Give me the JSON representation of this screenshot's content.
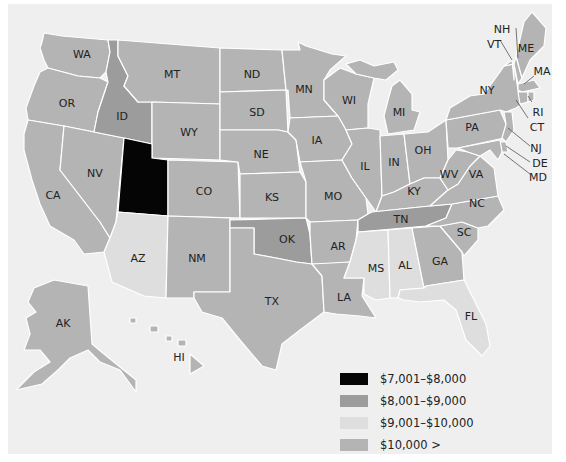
{
  "map": {
    "type": "choropleth",
    "region": "United States",
    "colors": {
      "c7001_8000": "#050505",
      "c8001_9000": "#9c9c9c",
      "c9001_10000": "#dedede",
      "c10000_plus": "#b4b4b4",
      "background": "#efefef",
      "border": "#ffffff"
    },
    "states": [
      {
        "abbr": "WA",
        "bin": "$10,000 >"
      },
      {
        "abbr": "OR",
        "bin": "$10,000 >"
      },
      {
        "abbr": "CA",
        "bin": "$10,000 >"
      },
      {
        "abbr": "NV",
        "bin": "$10,000 >"
      },
      {
        "abbr": "ID",
        "bin": "$8,001–$9,000"
      },
      {
        "abbr": "MT",
        "bin": "$10,000 >"
      },
      {
        "abbr": "WY",
        "bin": "$10,000 >"
      },
      {
        "abbr": "UT",
        "bin": "$7,001–$8,000"
      },
      {
        "abbr": "AZ",
        "bin": "$9,001–$10,000"
      },
      {
        "abbr": "CO",
        "bin": "$10,000 >"
      },
      {
        "abbr": "NM",
        "bin": "$10,000 >"
      },
      {
        "abbr": "ND",
        "bin": "$10,000 >"
      },
      {
        "abbr": "SD",
        "bin": "$10,000 >"
      },
      {
        "abbr": "NE",
        "bin": "$10,000 >"
      },
      {
        "abbr": "KS",
        "bin": "$10,000 >"
      },
      {
        "abbr": "OK",
        "bin": "$8,001–$9,000"
      },
      {
        "abbr": "TX",
        "bin": "$10,000 >"
      },
      {
        "abbr": "MN",
        "bin": "$10,000 >"
      },
      {
        "abbr": "IA",
        "bin": "$10,000 >"
      },
      {
        "abbr": "MO",
        "bin": "$10,000 >"
      },
      {
        "abbr": "AR",
        "bin": "$10,000 >"
      },
      {
        "abbr": "LA",
        "bin": "$10,000 >"
      },
      {
        "abbr": "WI",
        "bin": "$10,000 >"
      },
      {
        "abbr": "IL",
        "bin": "$10,000 >"
      },
      {
        "abbr": "MI",
        "bin": "$10,000 >"
      },
      {
        "abbr": "IN",
        "bin": "$10,000 >"
      },
      {
        "abbr": "OH",
        "bin": "$10,000 >"
      },
      {
        "abbr": "KY",
        "bin": "$10,000 >"
      },
      {
        "abbr": "TN",
        "bin": "$8,001–$9,000"
      },
      {
        "abbr": "MS",
        "bin": "$9,001–$10,000"
      },
      {
        "abbr": "AL",
        "bin": "$9,001–$10,000"
      },
      {
        "abbr": "GA",
        "bin": "$10,000 >"
      },
      {
        "abbr": "FL",
        "bin": "$9,001–$10,000"
      },
      {
        "abbr": "SC",
        "bin": "$10,000 >"
      },
      {
        "abbr": "NC",
        "bin": "$10,000 >"
      },
      {
        "abbr": "VA",
        "bin": "$10,000 >"
      },
      {
        "abbr": "WV",
        "bin": "$10,000 >"
      },
      {
        "abbr": "PA",
        "bin": "$10,000 >"
      },
      {
        "abbr": "NY",
        "bin": "$10,000 >"
      },
      {
        "abbr": "VT",
        "bin": "$10,000 >"
      },
      {
        "abbr": "NH",
        "bin": "$10,000 >"
      },
      {
        "abbr": "ME",
        "bin": "$10,000 >"
      },
      {
        "abbr": "MA",
        "bin": "$10,000 >"
      },
      {
        "abbr": "RI",
        "bin": "$10,000 >"
      },
      {
        "abbr": "CT",
        "bin": "$10,000 >"
      },
      {
        "abbr": "NJ",
        "bin": "$10,000 >"
      },
      {
        "abbr": "DE",
        "bin": "$10,000 >"
      },
      {
        "abbr": "MD",
        "bin": "$10,000 >"
      },
      {
        "abbr": "AK",
        "bin": "$10,000 >"
      },
      {
        "abbr": "HI",
        "bin": "$10,000 >"
      }
    ],
    "labels": {
      "WA": "WA",
      "OR": "OR",
      "CA": "CA",
      "NV": "NV",
      "ID": "ID",
      "MT": "MT",
      "WY": "WY",
      "CO": "CO",
      "AZ": "AZ",
      "NM": "NM",
      "ND": "ND",
      "SD": "SD",
      "NE": "NE",
      "KS": "KS",
      "OK": "OK",
      "TX": "TX",
      "MN": "MN",
      "IA": "IA",
      "MO": "MO",
      "AR": "AR",
      "LA": "LA",
      "WI": "WI",
      "IL": "IL",
      "MI": "MI",
      "IN": "IN",
      "OH": "OH",
      "KY": "KY",
      "TN": "TN",
      "MS": "MS",
      "AL": "AL",
      "GA": "GA",
      "FL": "FL",
      "SC": "SC",
      "NC": "NC",
      "VA": "VA",
      "WV": "WV",
      "PA": "PA",
      "NY": "NY",
      "VT": "VT",
      "NH": "NH",
      "ME": "ME",
      "MA": "MA",
      "RI": "RI",
      "CT": "CT",
      "NJ": "NJ",
      "DE": "DE",
      "MD": "MD",
      "AK": "AK",
      "HI": "HI"
    }
  },
  "legend": {
    "items": [
      {
        "label": "$7,001–$8,000",
        "color": "#050505"
      },
      {
        "label": "$8,001–$9,000",
        "color": "#9c9c9c"
      },
      {
        "label": "$9,001–$10,000",
        "color": "#dedede"
      },
      {
        "label": "$10,000 >",
        "color": "#b4b4b4"
      }
    ]
  }
}
